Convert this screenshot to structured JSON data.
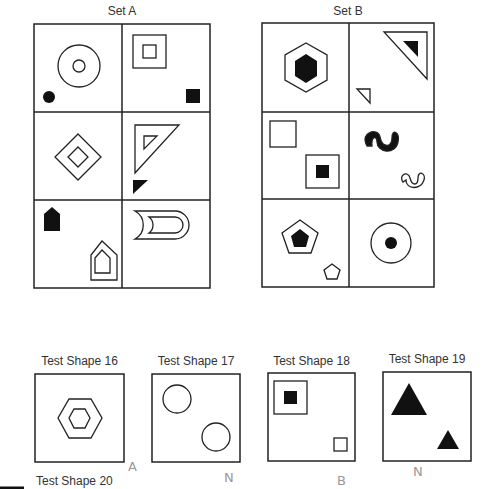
{
  "set_a": {
    "title": "Set A",
    "cells": [
      {
        "name": "circle-in-circle-with-small-dot",
        "outline": "concentric circles",
        "small": "filled circle"
      },
      {
        "name": "square-in-square-with-small-square",
        "outline": "concentric squares",
        "small": "filled square"
      },
      {
        "name": "diamond-in-diamond",
        "outline": "concentric diamonds",
        "small": "none"
      },
      {
        "name": "triangle-in-triangle-with-small-triangle",
        "outline": "concentric triangles",
        "small": "filled triangle"
      },
      {
        "name": "pentagon-house",
        "outline": "concentric house pentagons",
        "small": "filled house pentagon"
      },
      {
        "name": "crescent-d-shape",
        "outline": "nested D crescents",
        "small": "none"
      }
    ]
  },
  "set_b": {
    "title": "Set B",
    "cells": [
      {
        "name": "hexagon-with-filled-hexagon"
      },
      {
        "name": "triangle-with-filled-triangle-and-small-triangle"
      },
      {
        "name": "square-and-square-with-filled-square"
      },
      {
        "name": "filled-wave-and-outline-wave"
      },
      {
        "name": "pentagon-with-filled-pentagon-and-small-pentagon"
      },
      {
        "name": "circle-with-filled-dot"
      }
    ]
  },
  "tests": [
    {
      "label": "Test Shape 16",
      "answer": "A"
    },
    {
      "label": "Test Shape 17",
      "answer": "N"
    },
    {
      "label": "Test Shape 18",
      "answer": "B"
    },
    {
      "label": "Test Shape 19",
      "answer": "N"
    },
    {
      "label": "Test Shape 20",
      "answer": ""
    }
  ]
}
